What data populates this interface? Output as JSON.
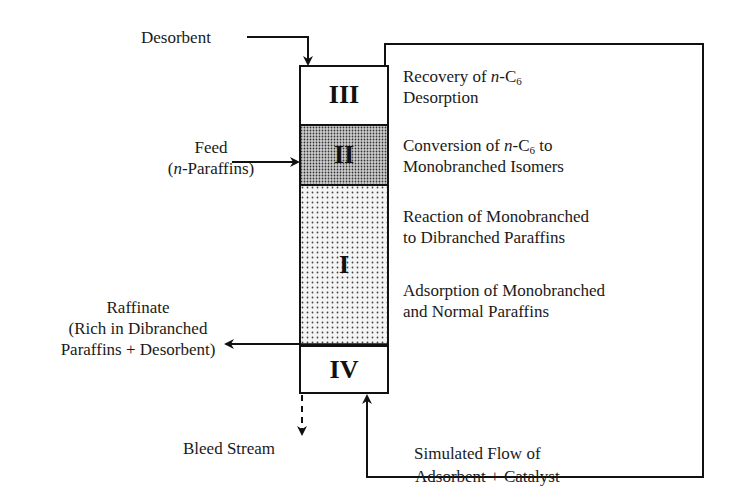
{
  "diagram": {
    "zones": [
      {
        "id": "III",
        "label": "III",
        "fill": "none",
        "description_line1_prefix": "Recovery of ",
        "description_line1_italic": "n",
        "description_line1_mid": "-C",
        "description_line1_sub": "6",
        "description_line1_suffix": "",
        "description_line2": "Desorption"
      },
      {
        "id": "II",
        "label": "II",
        "fill": "dense-dots",
        "description_line1_prefix": "Conversion of  ",
        "description_line1_italic": "n",
        "description_line1_mid": "-C",
        "description_line1_sub": "6",
        "description_line1_suffix": " to",
        "description_line2": "Monobranched Isomers"
      },
      {
        "id": "I",
        "label": "I",
        "fill": "sparse-dots",
        "descriptions": [
          {
            "line1": "Reaction of  Monobranched",
            "line2": "to Dibranched Paraffins"
          },
          {
            "line1": "Adsorption of  Monobranched",
            "line2": "and Normal Paraffins"
          }
        ]
      },
      {
        "id": "IV",
        "label": "IV",
        "fill": "none"
      }
    ],
    "streams": {
      "desorbent": {
        "label": "Desorbent",
        "direction": "in"
      },
      "feed": {
        "line1": "Feed",
        "line2_open": "(",
        "line2_italic": "n",
        "line2_rest": "-Paraffins)",
        "direction": "in"
      },
      "raffinate": {
        "line1": "Raffinate",
        "line2": "(Rich in  Dibranched",
        "line3": "Paraffins  + Desorbent)",
        "direction": "out"
      },
      "bleed": {
        "label": "Bleed Stream",
        "direction": "out",
        "style": "dashed"
      },
      "recycle": {
        "line1": "Simulated Flow of",
        "line2": "Adsorbent + Catalyst",
        "direction": "loop"
      }
    },
    "colors": {
      "line": "#111111",
      "dots": "#333333",
      "background": "#ffffff"
    }
  }
}
